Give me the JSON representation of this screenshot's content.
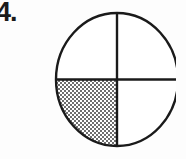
{
  "page": {
    "background_color": "#fdfdfd",
    "width": 186,
    "height": 159
  },
  "item": {
    "number_label": "4.",
    "number_color": "#1a1a1a"
  },
  "figure": {
    "name": "fraction-circle",
    "shape": "circle",
    "outline_color": "#1a1a1a",
    "outline_width": 2,
    "fill_color": "#ffffff",
    "shaded_color": "#808080",
    "shading_style": "halftone-dither",
    "center_x": 69,
    "center_y": 69.5,
    "radius_x": 62,
    "radius_y": 67.5,
    "divider_count": 2,
    "partitions": 4,
    "shaded_count": 1,
    "fraction_shaded": "1/4",
    "quadrants": [
      {
        "name": "top-left",
        "shaded": false
      },
      {
        "name": "top-right",
        "shaded": false
      },
      {
        "name": "bottom-left",
        "shaded": true
      },
      {
        "name": "bottom-right",
        "shaded": false
      }
    ]
  }
}
